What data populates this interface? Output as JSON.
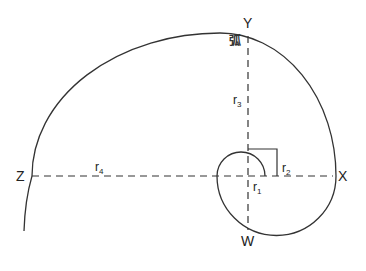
{
  "diagram": {
    "title": "",
    "points": {
      "Y": "Y",
      "X": "X",
      "Z": "Z",
      "W": "W"
    },
    "radii": {
      "r1": {
        "base": "r",
        "sub": "1"
      },
      "r2": {
        "base": "r",
        "sub": "2"
      },
      "r3": {
        "base": "r",
        "sub": "3"
      },
      "r4": {
        "base": "r",
        "sub": "4"
      }
    },
    "arc_label": "弧",
    "colors": {
      "stroke": "#333333",
      "background": "#ffffff"
    }
  }
}
